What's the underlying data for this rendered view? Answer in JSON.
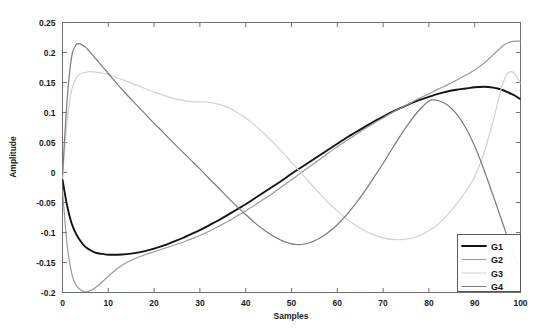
{
  "chart_data": {
    "type": "line",
    "title": "",
    "xlabel": "Samples",
    "ylabel": "Amplitude",
    "xlim": [
      0,
      100
    ],
    "ylim": [
      -0.2,
      0.25
    ],
    "xticks": [
      0,
      10,
      20,
      30,
      40,
      50,
      60,
      70,
      80,
      90,
      100
    ],
    "xtick_labels": [
      "0",
      "10",
      "20",
      "30",
      "40",
      "50",
      "60",
      "70",
      "80",
      "90",
      "100"
    ],
    "yticks": [
      -0.2,
      -0.15,
      -0.1,
      -0.05,
      0,
      0.05,
      0.1,
      0.15,
      0.2,
      0.25
    ],
    "ytick_labels": [
      "-0.2",
      "-0.15",
      "-0.1",
      "-0.05",
      "0",
      "0.05",
      "0.1",
      "0.15",
      "0.2",
      "0.25"
    ],
    "grid": false,
    "legend_position": "lower right",
    "series": [
      {
        "name": "G1",
        "color": "#141414",
        "width": 1.9,
        "x": [
          0,
          1,
          2,
          3,
          4,
          5,
          6,
          7,
          8,
          9,
          10,
          12,
          14,
          16,
          18,
          20,
          22,
          24,
          26,
          28,
          30,
          32,
          34,
          36,
          38,
          40,
          42,
          44,
          46,
          48,
          50,
          52,
          54,
          56,
          58,
          60,
          62,
          64,
          66,
          68,
          70,
          72,
          74,
          76,
          78,
          80,
          82,
          84,
          86,
          88,
          90,
          91,
          92,
          93,
          94,
          95,
          96,
          97,
          98,
          99,
          100
        ],
        "values": [
          -0.012,
          -0.055,
          -0.085,
          -0.103,
          -0.115,
          -0.124,
          -0.129,
          -0.133,
          -0.135,
          -0.136,
          -0.137,
          -0.137,
          -0.136,
          -0.134,
          -0.131,
          -0.127,
          -0.122,
          -0.116,
          -0.11,
          -0.103,
          -0.096,
          -0.088,
          -0.08,
          -0.071,
          -0.062,
          -0.053,
          -0.043,
          -0.033,
          -0.023,
          -0.013,
          -0.002,
          0.008,
          0.018,
          0.028,
          0.038,
          0.048,
          0.058,
          0.067,
          0.076,
          0.085,
          0.093,
          0.101,
          0.108,
          0.115,
          0.121,
          0.126,
          0.131,
          0.135,
          0.138,
          0.14,
          0.142,
          0.1425,
          0.1428,
          0.1425,
          0.1415,
          0.14,
          0.1375,
          0.1345,
          0.131,
          0.127,
          0.122
        ]
      },
      {
        "name": "G2",
        "color": "#9a9a9a",
        "width": 1.2,
        "x": [
          0,
          1,
          2,
          3,
          4,
          5,
          6,
          7,
          8,
          9,
          10,
          12,
          14,
          16,
          18,
          20,
          22,
          24,
          26,
          28,
          30,
          32,
          34,
          36,
          38,
          40,
          42,
          44,
          46,
          48,
          50,
          52,
          54,
          56,
          58,
          60,
          62,
          64,
          66,
          68,
          70,
          72,
          74,
          76,
          78,
          80,
          82,
          84,
          86,
          88,
          90,
          92,
          94,
          95,
          96,
          97,
          98,
          99,
          100
        ],
        "values": [
          -0.03,
          -0.12,
          -0.168,
          -0.188,
          -0.196,
          -0.199,
          -0.197,
          -0.193,
          -0.187,
          -0.18,
          -0.173,
          -0.16,
          -0.15,
          -0.143,
          -0.137,
          -0.132,
          -0.127,
          -0.122,
          -0.117,
          -0.111,
          -0.105,
          -0.098,
          -0.09,
          -0.082,
          -0.073,
          -0.064,
          -0.054,
          -0.044,
          -0.034,
          -0.023,
          -0.012,
          -0.001,
          0.01,
          0.021,
          0.032,
          0.043,
          0.053,
          0.063,
          0.073,
          0.082,
          0.091,
          0.1,
          0.108,
          0.116,
          0.124,
          0.131,
          0.139,
          0.146,
          0.154,
          0.162,
          0.171,
          0.182,
          0.196,
          0.203,
          0.21,
          0.215,
          0.218,
          0.219,
          0.219
        ]
      },
      {
        "name": "G3",
        "color": "#d2d2d2",
        "width": 1.2,
        "x": [
          0,
          1,
          2,
          3,
          4,
          5,
          6,
          7,
          8,
          9,
          10,
          12,
          14,
          16,
          18,
          20,
          22,
          24,
          26,
          28,
          30,
          31,
          32,
          34,
          36,
          38,
          40,
          42,
          44,
          46,
          48,
          50,
          52,
          54,
          56,
          58,
          60,
          62,
          64,
          66,
          68,
          70,
          72,
          74,
          76,
          78,
          80,
          82,
          84,
          86,
          88,
          90,
          92,
          94,
          95,
          96,
          97,
          98,
          99,
          100
        ],
        "values": [
          -0.01,
          0.085,
          0.138,
          0.158,
          0.165,
          0.167,
          0.168,
          0.1675,
          0.1665,
          0.165,
          0.163,
          0.158,
          0.152,
          0.146,
          0.14,
          0.134,
          0.129,
          0.124,
          0.1205,
          0.118,
          0.1175,
          0.1175,
          0.117,
          0.114,
          0.109,
          0.101,
          0.091,
          0.079,
          0.065,
          0.05,
          0.034,
          0.017,
          0.0,
          -0.017,
          -0.034,
          -0.05,
          -0.064,
          -0.077,
          -0.088,
          -0.097,
          -0.104,
          -0.109,
          -0.1115,
          -0.112,
          -0.11,
          -0.105,
          -0.097,
          -0.086,
          -0.071,
          -0.053,
          -0.032,
          -0.007,
          0.032,
          0.085,
          0.116,
          0.145,
          0.163,
          0.168,
          0.162,
          0.148
        ]
      },
      {
        "name": "G4",
        "color": "#7b7b7b",
        "width": 1.2,
        "x": [
          0,
          1,
          2,
          3,
          4,
          5,
          6,
          7,
          8,
          9,
          10,
          12,
          14,
          16,
          18,
          20,
          22,
          24,
          26,
          28,
          30,
          32,
          34,
          36,
          38,
          40,
          42,
          44,
          46,
          48,
          50,
          51,
          52,
          54,
          56,
          58,
          60,
          62,
          64,
          66,
          68,
          70,
          72,
          74,
          76,
          78,
          80,
          81,
          82,
          84,
          86,
          88,
          90,
          92,
          94,
          96,
          98,
          100
        ],
        "values": [
          -0.005,
          0.12,
          0.193,
          0.213,
          0.214,
          0.209,
          0.201,
          0.192,
          0.183,
          0.174,
          0.165,
          0.147,
          0.13,
          0.114,
          0.098,
          0.082,
          0.067,
          0.051,
          0.036,
          0.021,
          0.006,
          -0.01,
          -0.025,
          -0.041,
          -0.056,
          -0.07,
          -0.084,
          -0.096,
          -0.106,
          -0.114,
          -0.119,
          -0.12,
          -0.12,
          -0.117,
          -0.11,
          -0.1,
          -0.087,
          -0.071,
          -0.052,
          -0.031,
          -0.008,
          0.015,
          0.04,
          0.064,
          0.086,
          0.105,
          0.119,
          0.121,
          0.12,
          0.113,
          0.098,
          0.075,
          0.044,
          0.005,
          -0.038,
          -0.082,
          -0.126,
          -0.168
        ]
      }
    ]
  },
  "legend": {
    "entries": [
      {
        "label": "G1"
      },
      {
        "label": "G2"
      },
      {
        "label": "G3"
      },
      {
        "label": "G4"
      }
    ]
  }
}
